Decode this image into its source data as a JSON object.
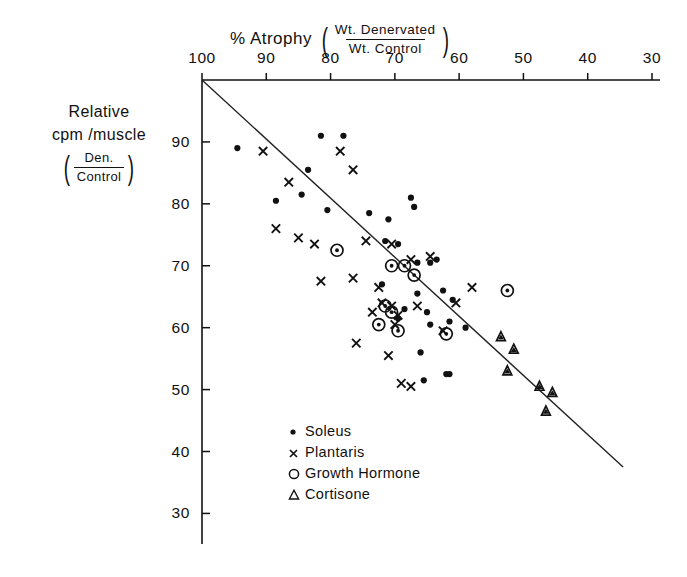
{
  "chart_data": {
    "type": "scatter",
    "title": "% Atrophy",
    "title_fraction": {
      "numerator": "Wt. Denervated",
      "denominator": "Wt. Control"
    },
    "xlabel": "% Atrophy (Wt. Denervated / Wt. Control)",
    "ylabel": "Relative cpm/muscle (Den./Control)",
    "ylabel_lines": [
      "Relative",
      "cpm /muscle"
    ],
    "ylabel_fraction": {
      "numerator": "Den.",
      "denominator": "Control"
    },
    "xlim": [
      100,
      30
    ],
    "ylim": [
      27,
      100
    ],
    "x_reversed": true,
    "grid": false,
    "legend_position": "bottom-center",
    "xticks": [
      100,
      90,
      80,
      70,
      60,
      50,
      40,
      30
    ],
    "yticks": [
      90,
      80,
      70,
      60,
      50,
      40,
      30
    ],
    "axis_position": {
      "x_axis": "top",
      "y_axis": "left"
    },
    "trendline": {
      "x": [
        100,
        34.5
      ],
      "y": [
        100,
        37.5
      ],
      "label": "regression line"
    },
    "series": [
      {
        "name": "Soleus",
        "marker": "filled-circle",
        "color": "#111111",
        "points": [
          [
            94.5,
            89.0
          ],
          [
            81.5,
            91.0
          ],
          [
            78.0,
            91.0
          ],
          [
            83.5,
            85.5
          ],
          [
            88.5,
            80.5
          ],
          [
            84.5,
            81.5
          ],
          [
            80.5,
            79.0
          ],
          [
            74.0,
            78.5
          ],
          [
            71.0,
            77.5
          ],
          [
            67.5,
            81.0
          ],
          [
            67.0,
            79.5
          ],
          [
            71.5,
            74.0
          ],
          [
            69.5,
            73.5
          ],
          [
            66.5,
            70.5
          ],
          [
            64.5,
            70.5
          ],
          [
            63.5,
            71.0
          ],
          [
            72.0,
            67.0
          ],
          [
            66.5,
            65.5
          ],
          [
            68.5,
            63.0
          ],
          [
            65.0,
            62.5
          ],
          [
            62.5,
            66.0
          ],
          [
            61.0,
            64.5
          ],
          [
            69.5,
            61.5
          ],
          [
            64.5,
            60.5
          ],
          [
            61.5,
            61.0
          ],
          [
            59.0,
            60.0
          ],
          [
            66.0,
            56.0
          ],
          [
            65.5,
            51.5
          ],
          [
            62.0,
            52.5
          ],
          [
            61.5,
            52.5
          ]
        ]
      },
      {
        "name": "Plantaris",
        "marker": "x",
        "color": "#111111",
        "points": [
          [
            90.5,
            88.5
          ],
          [
            86.5,
            83.5
          ],
          [
            78.5,
            88.5
          ],
          [
            76.5,
            85.5
          ],
          [
            88.5,
            76.0
          ],
          [
            85.0,
            74.5
          ],
          [
            82.5,
            73.5
          ],
          [
            74.5,
            74.0
          ],
          [
            70.5,
            73.5
          ],
          [
            67.5,
            71.0
          ],
          [
            64.5,
            71.5
          ],
          [
            76.5,
            68.0
          ],
          [
            72.5,
            66.5
          ],
          [
            81.5,
            67.5
          ],
          [
            72.0,
            64.0
          ],
          [
            70.5,
            63.5
          ],
          [
            73.5,
            62.5
          ],
          [
            69.5,
            62.0
          ],
          [
            70.0,
            60.5
          ],
          [
            66.5,
            63.5
          ],
          [
            76.0,
            57.5
          ],
          [
            71.0,
            55.5
          ],
          [
            62.5,
            59.5
          ],
          [
            60.5,
            64.0
          ],
          [
            58.0,
            66.5
          ],
          [
            69.0,
            51.0
          ],
          [
            67.5,
            50.5
          ]
        ]
      },
      {
        "name": "Growth Hormone",
        "marker": "circle",
        "color": "#111111",
        "points": [
          [
            79.0,
            72.5
          ],
          [
            70.5,
            70.0
          ],
          [
            68.5,
            70.0
          ],
          [
            67.0,
            68.5
          ],
          [
            71.5,
            63.5
          ],
          [
            70.5,
            62.5
          ],
          [
            72.5,
            60.5
          ],
          [
            69.5,
            59.5
          ],
          [
            62.0,
            59.0
          ],
          [
            52.5,
            66.0
          ]
        ]
      },
      {
        "name": "Cortisone",
        "marker": "triangle",
        "color": "#111111",
        "points": [
          [
            53.5,
            58.5
          ],
          [
            51.5,
            56.5
          ],
          [
            52.5,
            53.0
          ],
          [
            47.5,
            50.5
          ],
          [
            45.5,
            49.5
          ],
          [
            46.5,
            46.5
          ]
        ]
      }
    ]
  },
  "legend": {
    "items": [
      {
        "label": "Soleus",
        "marker": "filled-circle"
      },
      {
        "label": "Plantaris",
        "marker": "x"
      },
      {
        "label": "Growth Hormone",
        "marker": "circle"
      },
      {
        "label": "Cortisone",
        "marker": "triangle"
      }
    ]
  }
}
